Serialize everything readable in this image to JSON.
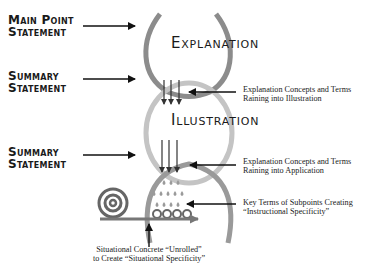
{
  "left_labels": {
    "main_point": {
      "line1": "Main Point",
      "line2": "Statement"
    },
    "summary_1": {
      "line1": "Summary",
      "line2": "Statement"
    },
    "summary_2": {
      "line1": "Summary",
      "line2": "Statement"
    }
  },
  "sections": {
    "explanation": "Explanation",
    "illustration": "Illustration"
  },
  "right_notes": {
    "raining_illustration": {
      "line1": "Explanation Concepts and Terms",
      "line2": "Raining into Illustration"
    },
    "raining_application": {
      "line1": "Explanation Concepts and Terms",
      "line2": "Raining into Application"
    },
    "key_terms": {
      "line1": "Key Terms of Subpoints Creating",
      "line2": "“Instructional Specificity”"
    }
  },
  "bottom_note": {
    "line1": "Situational Concrete “Unrolled”",
    "line2": "to Create “Situational Specificity”"
  },
  "colors": {
    "loop_top": "#8c8c8c",
    "loop_middle": "#c4c4c4",
    "loop_bottom": "#9a9a9a",
    "arrow": "#111111",
    "roll": "#666666",
    "drops": "#9a9a9a"
  }
}
